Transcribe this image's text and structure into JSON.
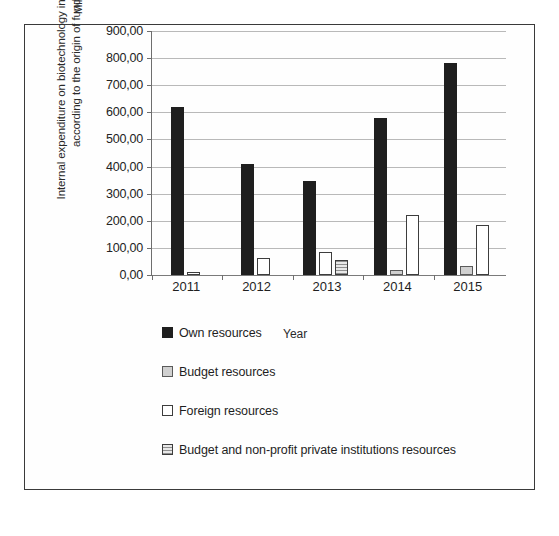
{
  "figure": {
    "vertical_caption": "Internal expenditure on biotechnology in enterprises according to the origin of funds",
    "y_axis_title": "Millions of PLN",
    "x_axis_title": "Year"
  },
  "legend": {
    "items": [
      {
        "label": "Own resources",
        "swatch": "black-filled-swatch",
        "color": "#1f1f1f"
      },
      {
        "label": "Budget resources",
        "swatch": "light-gray-swatch",
        "color": "#d0d0d0"
      },
      {
        "label": "Foreign resources",
        "swatch": "white-swatch",
        "color": "#ffffff"
      },
      {
        "label": "Budget and non-profit private institutions resources",
        "swatch": "hatched-gray-swatch",
        "color": "#cfcfcf"
      }
    ]
  },
  "chart_data": {
    "type": "bar",
    "title": "",
    "xlabel": "Year",
    "ylabel": "Millions of PLN",
    "categories": [
      "2011",
      "2012",
      "2013",
      "2014",
      "2015"
    ],
    "ylim": [
      0,
      900
    ],
    "ytick_labels": [
      "0,00",
      "100,00",
      "200,00",
      "300,00",
      "400,00",
      "500,00",
      "600,00",
      "700,00",
      "800,00",
      "900,00"
    ],
    "ytick_values": [
      0,
      100,
      200,
      300,
      400,
      500,
      600,
      700,
      800,
      900
    ],
    "grid": true,
    "legend_position": "below-left",
    "decimal_separator": ",",
    "series": [
      {
        "name": "Own resources",
        "color": "#1f1f1f",
        "values": [
          620,
          410,
          347,
          580,
          783
        ]
      },
      {
        "name": "Budget resources",
        "color": "#d0d0d0",
        "values": [
          null,
          null,
          null,
          20,
          35
        ]
      },
      {
        "name": "Foreign resources",
        "color": "#ffffff",
        "values": [
          10,
          62,
          85,
          220,
          185
        ]
      },
      {
        "name": "Budget and non-profit private institutions resources",
        "color": "#cfcfcf",
        "values": [
          null,
          null,
          55,
          null,
          null
        ]
      }
    ]
  }
}
